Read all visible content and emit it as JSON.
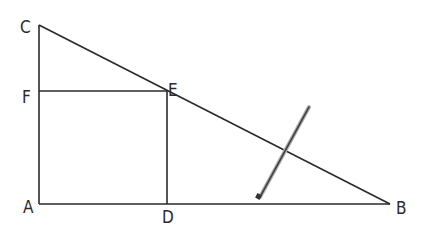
{
  "diagram": {
    "type": "geometry-figure",
    "points": {
      "A": {
        "label": "A",
        "x": 39,
        "y": 204
      },
      "B": {
        "label": "B",
        "x": 390,
        "y": 204
      },
      "C": {
        "label": "C",
        "x": 39,
        "y": 25
      },
      "D": {
        "label": "D",
        "x": 167,
        "y": 204
      },
      "E": {
        "label": "E",
        "x": 167,
        "y": 91
      },
      "F": {
        "label": "F",
        "x": 39,
        "y": 91
      }
    },
    "segments": [
      "CA",
      "AB",
      "CB",
      "FE",
      "ED"
    ],
    "arrow": {
      "from": [
        309,
        107
      ],
      "to": [
        259,
        199
      ],
      "description": "pencil arrow pointing toward segment DB"
    },
    "colors": {
      "line": "#2a2a2a",
      "arrow": "#555555",
      "background": "#ffffff"
    }
  }
}
